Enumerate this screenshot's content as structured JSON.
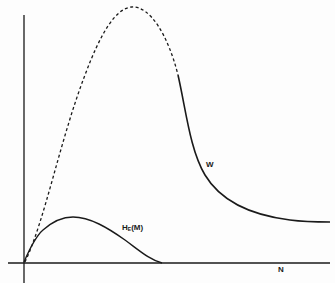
{
  "diagram": {
    "type": "curve-sketch",
    "axes": {
      "x_label": "N",
      "y_label": ""
    },
    "curves": [
      {
        "name": "W",
        "label": "W",
        "style": "dashed rising to peak, then solid decaying to plateau",
        "description": "Rises from origin (dashed) to a tall maximum, then falls (solid) and levels off to a nonzero asymptote"
      },
      {
        "name": "H_E(M)",
        "label_main": "H",
        "label_sub": "E",
        "label_suffix": "(M)",
        "style": "solid",
        "description": "Small hump from origin, peaks early, returns to zero"
      }
    ],
    "colors": {
      "ink": "#1a1a1a",
      "background": "#fdfdfd"
    }
  }
}
